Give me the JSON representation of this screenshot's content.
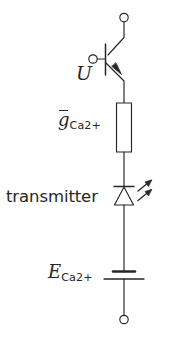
{
  "diagram": {
    "type": "electrical-schematic",
    "background_color": "#ffffff",
    "line_color": "#262626",
    "text_color": "#262626"
  },
  "labels": {
    "voltage": {
      "text": "U",
      "style": "math-italic",
      "meaning": "membrane voltage applied at transistor base"
    },
    "conductance": {
      "base": "g",
      "overbar": true,
      "subscript": "Ca2+",
      "style": "math-italic",
      "meaning": "maximal calcium conductance (resistor)"
    },
    "transmitter": {
      "text": "transmitter",
      "style": "sans",
      "meaning": "light emitting diode representing transmitter release"
    },
    "reversal_potential": {
      "base": "E",
      "overbar": false,
      "subscript": "Ca2+",
      "style": "math-italic",
      "meaning": "calcium reversal potential (battery)"
    }
  },
  "components": {
    "terminal_top": "open-terminal-circle",
    "transistor": "npn-bipolar-transistor",
    "transistor_base_terminal": "open-terminal-circle",
    "resistor": "rectangular-resistor",
    "led": "light-emitting-diode",
    "battery": "battery-cell",
    "terminal_bottom": "open-terminal-circle"
  }
}
